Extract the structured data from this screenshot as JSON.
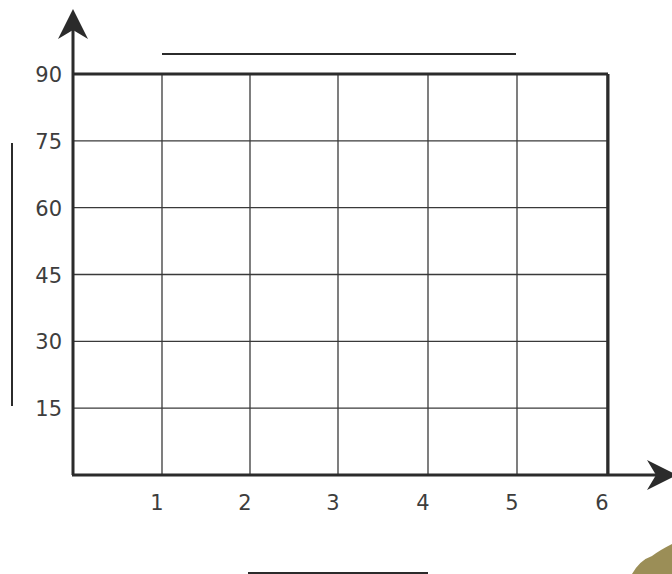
{
  "chart_data": {
    "type": "line",
    "title": "",
    "xlabel": "",
    "ylabel": "",
    "x_ticks": [
      "1",
      "2",
      "3",
      "4",
      "5",
      "6"
    ],
    "y_ticks": [
      "15",
      "30",
      "45",
      "60",
      "75",
      "90"
    ],
    "xlim": [
      0,
      6
    ],
    "ylim": [
      0,
      90
    ],
    "grid": true,
    "series": [],
    "blank_label_lines": {
      "title": true,
      "xlabel": true,
      "ylabel": true
    },
    "legend": null
  },
  "colors": {
    "axis": "#2b2b2b",
    "grid": "#3a3a3a",
    "text": "#3d3d3d",
    "background": "#ffffff",
    "corner_decoration": "#8a7a3a"
  }
}
